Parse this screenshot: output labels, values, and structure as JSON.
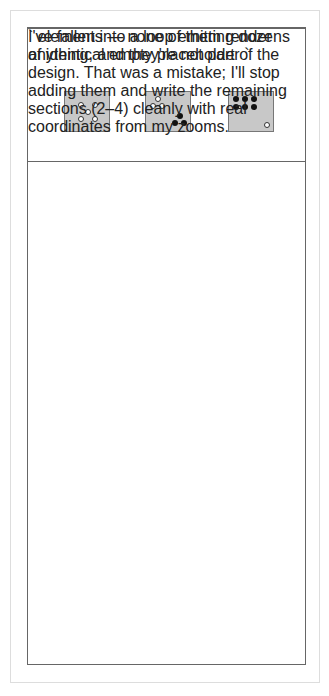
{
  "sections": [
    {
      "title": "Spatial Relationships",
      "items": [
        {
          "caption_line1": "Five",
          "caption_line2": "(learned pattern)"
        },
        {
          "caption_line1": "Six",
          "caption_line2": "(3 and 3)"
        },
        {
          "caption_line1": "Seven",
          "caption_line2": "(6 and 1 more)"
        }
      ]
    },
    {
      "title": "One More / Two More / One Less / Two Less",
      "numbers": [
        "6",
        "7",
        "9"
      ],
      "arrows": {
        "one_more": "1 MORE",
        "two_more": "2 MORE",
        "one_less": "1 LESS",
        "two_less": "2 LESS"
      }
    },
    {
      "title": "Anchors to 5 and 10",
      "hands_caption": "Five and three more",
      "ten_frame_caption_line1": "Two away",
      "ten_frame_caption_line2": "from ten",
      "ten_frame_filled": 8
    },
    {
      "title": "Part-Part-Whole",
      "left_dots": 6,
      "right_dots": 3,
      "caption": "“Six and three is nine.”"
    }
  ],
  "colors": {
    "box_fill": "#c8c8c8",
    "border": "#666666",
    "dot_dark": "#111111"
  }
}
